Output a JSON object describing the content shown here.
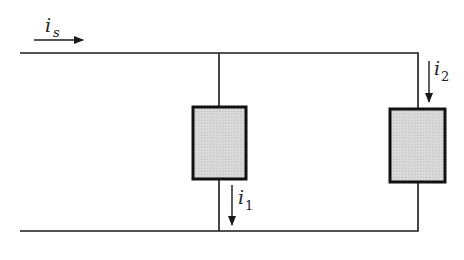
{
  "diagram": {
    "type": "parallel-circuit",
    "colors": {
      "wire": "#1a1a1a",
      "element_fill": "#d4d4d4",
      "element_border": "#111111",
      "background": "#ffffff"
    },
    "currents": {
      "source": {
        "symbol": "i",
        "subscript": "s",
        "direction": "right"
      },
      "branch1": {
        "symbol": "i",
        "subscript": "1",
        "direction": "down"
      },
      "branch2": {
        "symbol": "i",
        "subscript": "2",
        "direction": "down"
      }
    },
    "elements": [
      {
        "id": "element-1",
        "label": ""
      },
      {
        "id": "element-2",
        "label": ""
      }
    ]
  }
}
